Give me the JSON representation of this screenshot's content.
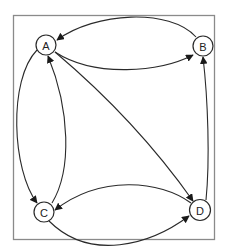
{
  "diagram": {
    "type": "directed-graph",
    "nodes": [
      {
        "id": "A",
        "label": "A"
      },
      {
        "id": "B",
        "label": "B"
      },
      {
        "id": "C",
        "label": "C"
      },
      {
        "id": "D",
        "label": "D"
      }
    ],
    "edges": [
      {
        "from": "B",
        "to": "A"
      },
      {
        "from": "A",
        "to": "B"
      },
      {
        "from": "A",
        "to": "C"
      },
      {
        "from": "C",
        "to": "A"
      },
      {
        "from": "A",
        "to": "D"
      },
      {
        "from": "D",
        "to": "B"
      },
      {
        "from": "D",
        "to": "C"
      },
      {
        "from": "C",
        "to": "D"
      }
    ],
    "colors": {
      "stroke": "#2a2a2a",
      "frame": "#8a8a8a",
      "background": "#ffffff"
    }
  }
}
